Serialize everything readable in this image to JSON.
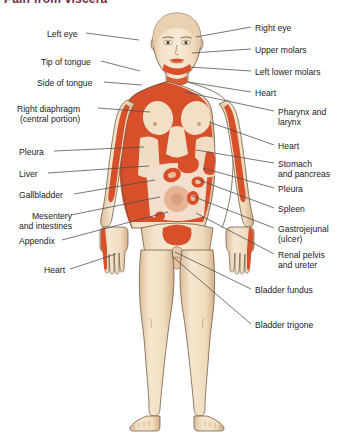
{
  "title": "Pain from viscera",
  "colors": {
    "referred_pain": "#d8502a",
    "referred_pain_light": "#e8a183",
    "skin": "#f2e0c6",
    "skin_shadow": "#d8b793",
    "outline": "#5a4632",
    "leader_line": "#4a4a52",
    "text": "#1b1b1b",
    "title": "#6b2f4a",
    "background": "#ffffff"
  },
  "figure": {
    "view": "anterior"
  },
  "labels_left": [
    {
      "text": "Left eye",
      "text2": "",
      "x": 47,
      "y": 29,
      "line": [
        [
          86,
          33
        ],
        [
          139,
          40
        ]
      ]
    },
    {
      "text": "Tip of tongue",
      "text2": "",
      "x": 41,
      "y": 57,
      "line": [
        [
          101,
          61
        ],
        [
          140,
          71
        ]
      ]
    },
    {
      "text": "Side of tongue",
      "text2": "",
      "x": 37,
      "y": 78,
      "line": [
        [
          104,
          82
        ],
        [
          142,
          85
        ]
      ]
    },
    {
      "text": "Right diaphragm",
      "text2": "(central portion)",
      "x": 17,
      "y": 104,
      "line": [
        [
          98,
          108
        ],
        [
          150,
          112
        ]
      ]
    },
    {
      "text": "Pleura",
      "text2": "",
      "x": 19,
      "y": 147,
      "line": [
        [
          54,
          151
        ],
        [
          144,
          147
        ]
      ]
    },
    {
      "text": "Liver",
      "text2": "",
      "x": 19,
      "y": 169,
      "line": [
        [
          48,
          173
        ],
        [
          149,
          166
        ]
      ]
    },
    {
      "text": "Gallbladder",
      "text2": "",
      "x": 19,
      "y": 190,
      "line": [
        [
          74,
          194
        ],
        [
          155,
          180
        ]
      ]
    },
    {
      "text": "Mesentery",
      "text2": "and intestines",
      "x": 19,
      "y": 211,
      "line": [
        [
          71,
          215
        ],
        [
          160,
          197
        ]
      ]
    },
    {
      "text": "Appendix",
      "text2": "",
      "x": 19,
      "y": 236,
      "line": [
        [
          62,
          240
        ],
        [
          168,
          212
        ]
      ]
    },
    {
      "text": "Heart",
      "text2": "",
      "x": 44,
      "y": 265,
      "line": [
        [
          70,
          269
        ],
        [
          116,
          254
        ]
      ]
    }
  ],
  "labels_right": [
    {
      "text": "Right eye",
      "text2": "",
      "x": 255,
      "y": 23,
      "line": [
        [
          251,
          27
        ],
        [
          196,
          37
        ]
      ]
    },
    {
      "text": "Upper molars",
      "text2": "",
      "x": 255,
      "y": 45,
      "line": [
        [
          251,
          49
        ],
        [
          192,
          53
        ]
      ]
    },
    {
      "text": "Left lower molars",
      "text2": "",
      "x": 255,
      "y": 67,
      "line": [
        [
          251,
          71
        ],
        [
          190,
          67
        ]
      ]
    },
    {
      "text": "Heart",
      "text2": "",
      "x": 255,
      "y": 88,
      "line": [
        [
          251,
          92
        ],
        [
          188,
          82
        ]
      ]
    },
    {
      "text": "Pharynx and",
      "text2": "larynx",
      "x": 278,
      "y": 107,
      "line": [
        [
          274,
          111
        ],
        [
          185,
          92
        ]
      ]
    },
    {
      "text": "Heart",
      "text2": "",
      "x": 278,
      "y": 141,
      "line": [
        [
          274,
          145
        ],
        [
          209,
          122
        ]
      ]
    },
    {
      "text": "Stomach",
      "text2": "and pancreas",
      "x": 278,
      "y": 159,
      "line": [
        [
          274,
          163
        ],
        [
          196,
          150
        ]
      ]
    },
    {
      "text": "Pleura",
      "text2": "",
      "x": 278,
      "y": 184,
      "line": [
        [
          274,
          188
        ],
        [
          203,
          168
        ]
      ]
    },
    {
      "text": "Spleen",
      "text2": "",
      "x": 278,
      "y": 204,
      "line": [
        [
          274,
          208
        ],
        [
          199,
          180
        ]
      ]
    },
    {
      "text": "Gastrojejunal",
      "text2": "(ulcer)",
      "x": 278,
      "y": 224,
      "line": [
        [
          274,
          228
        ],
        [
          192,
          196
        ]
      ]
    },
    {
      "text": "Renal pelvis",
      "text2": "and ureter",
      "x": 278,
      "y": 250,
      "line": [
        [
          274,
          254
        ],
        [
          196,
          213
        ]
      ]
    },
    {
      "text": "Bladder fundus",
      "text2": "",
      "x": 255,
      "y": 285,
      "line": [
        [
          251,
          289
        ],
        [
          175,
          252
        ]
      ]
    },
    {
      "text": "Bladder trigone",
      "text2": "",
      "x": 255,
      "y": 320,
      "line": [
        [
          251,
          324
        ],
        [
          173,
          257
        ]
      ]
    }
  ]
}
